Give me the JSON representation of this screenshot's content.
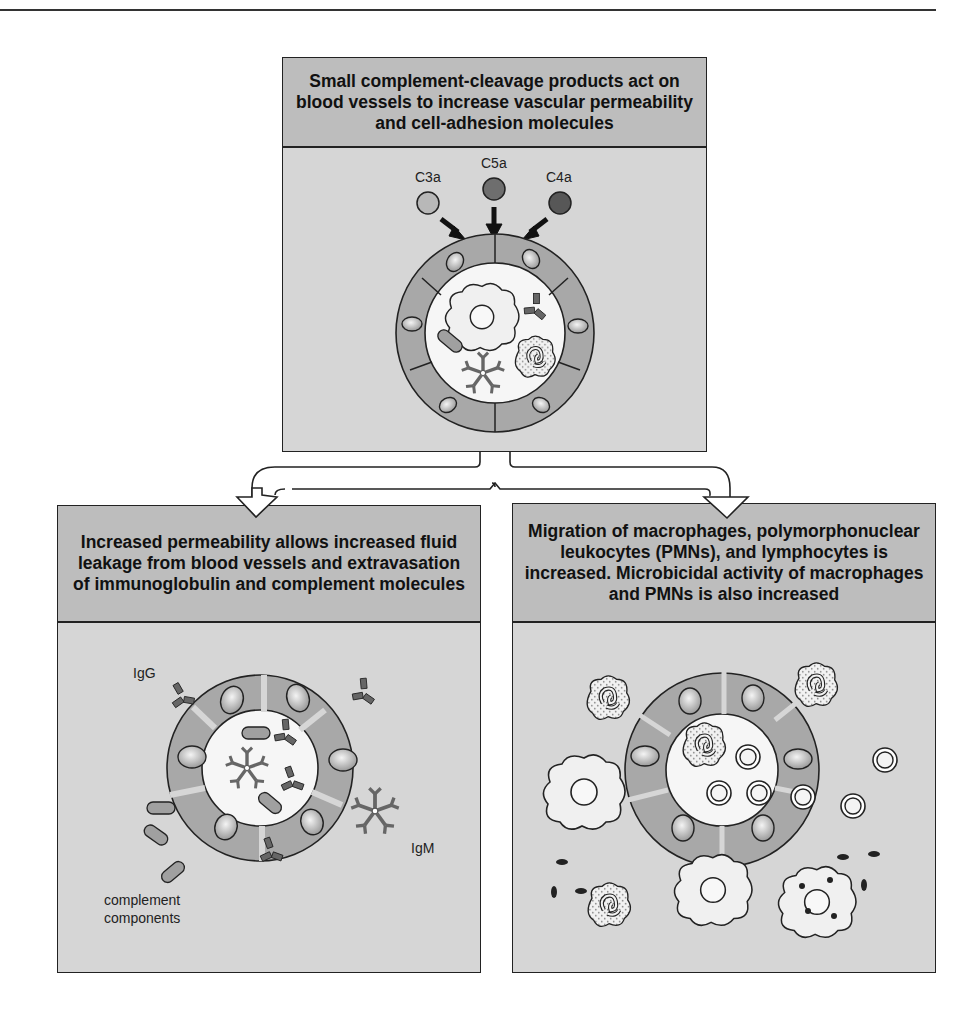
{
  "top_panel": {
    "title": "Small complement-cleavage products act on blood vessels to increase vascular permeability and cell-adhesion molecules",
    "labels": {
      "c3a": "C3a",
      "c5a": "C5a",
      "c4a": "C4a"
    },
    "colors": {
      "c3a": "#b8b8b8",
      "c5a": "#6e6e6e",
      "c4a": "#575757"
    }
  },
  "left_panel": {
    "title": "Increased permeability allows increased fluid leakage from blood vessels and extravasation of immunoglobulin and complement molecules",
    "labels": {
      "igg": "IgG",
      "igm": "IgM",
      "complement_line1": "complement",
      "complement_line2": "components"
    }
  },
  "right_panel": {
    "title": "Migration of macrophages, polymorphonuclear leukocytes (PMNs), and lymphocytes is increased. Microbicidal activity of macrophages and PMNs is also increased"
  },
  "colors": {
    "header_fill": "#bdbdbd",
    "body_fill": "#d6d6d6",
    "endothelium": "#a8a8a8",
    "antibody": "#666666",
    "outline": "#222222"
  }
}
